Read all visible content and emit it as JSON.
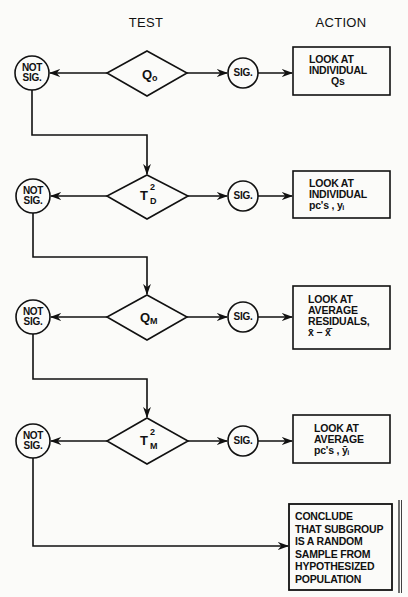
{
  "headers": {
    "test": "TEST",
    "action": "ACTION"
  },
  "rows": [
    {
      "not_sig": {
        "line1": "NOT",
        "line2": "SIG."
      },
      "test": {
        "symbol": "Q",
        "sup": "",
        "sub": "o"
      },
      "sig": "SIG.",
      "action": [
        "LOOK AT",
        "INDIVIDUAL",
        "Qs"
      ]
    },
    {
      "not_sig": {
        "line1": "NOT",
        "line2": "SIG."
      },
      "test": {
        "symbol": "T",
        "sup": "2",
        "sub": "D"
      },
      "sig": "SIG.",
      "action": [
        "LOOK AT",
        "INDIVIDUAL",
        "pc's , yᵢ"
      ]
    },
    {
      "not_sig": {
        "line1": "NOT",
        "line2": "SIG."
      },
      "test": {
        "symbol": "Q",
        "sup": "",
        "sub": "M"
      },
      "sig": "SIG.",
      "action": [
        "LOOK AT",
        "AVERAGE",
        "RESIDUALS,",
        "x̄ − x̂̄"
      ]
    },
    {
      "not_sig": {
        "line1": "NOT",
        "line2": "SIG."
      },
      "test": {
        "symbol": "T",
        "sup": "2",
        "sub": "M"
      },
      "sig": "SIG.",
      "action": [
        "LOOK AT",
        "AVERAGE",
        "pc's , ȳᵢ"
      ]
    }
  ],
  "conclusion": [
    "CONCLUDE",
    "THAT SUBGROUP",
    "IS A RANDOM",
    "SAMPLE FROM",
    "HYPOTHESIZED",
    "POPULATION"
  ],
  "colors": {
    "ink": "#111111",
    "paper": "#fbfbf9"
  }
}
